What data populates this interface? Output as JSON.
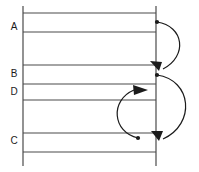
{
  "diagram": {
    "type": "interval-arc-diagram",
    "colors": {
      "background": "#ffffff",
      "line": "#4a4a4a",
      "axis": "#3a3a3a",
      "arc": "#1b1b1b",
      "label": "#1b1b1b"
    },
    "axes": {
      "left_axis": {
        "name": "left-vertical-axis",
        "x": 23,
        "y1": 6,
        "y2": 166
      },
      "right_axis": {
        "name": "right-vertical-axis",
        "x": 156,
        "y1": 6,
        "y2": 166
      }
    },
    "rows": [
      {
        "id": "row-1",
        "label": "A",
        "label_x": 14,
        "label_y": 27,
        "line_top_y": 13,
        "line_bottom_y": 32
      },
      {
        "id": "row-2",
        "label": "",
        "label_x": 14,
        "label_y": 48,
        "line_top_y": 32,
        "line_bottom_y": 65
      },
      {
        "id": "row-3",
        "label": "B",
        "label_x": 14,
        "label_y": 74,
        "line_top_y": 65,
        "line_bottom_y": 84
      },
      {
        "id": "row-4",
        "label": "D",
        "label_x": 14,
        "label_y": 92,
        "line_top_y": 84,
        "line_bottom_y": 100
      },
      {
        "id": "row-5",
        "label": "",
        "label_x": 14,
        "label_y": 116,
        "line_top_y": 100,
        "line_bottom_y": 133
      },
      {
        "id": "row-6",
        "label": "C",
        "label_x": 14,
        "label_y": 141,
        "line_top_y": 133,
        "line_bottom_y": 152
      }
    ],
    "horizontal_lines": [
      {
        "id": "hline-1",
        "y": 13,
        "x1": 23,
        "x2": 156
      },
      {
        "id": "hline-2",
        "y": 32,
        "x1": 23,
        "x2": 156
      },
      {
        "id": "hline-3",
        "y": 65,
        "x1": 23,
        "x2": 156
      },
      {
        "id": "hline-4",
        "y": 84,
        "x1": 23,
        "x2": 156
      },
      {
        "id": "hline-5",
        "y": 100,
        "x1": 23,
        "x2": 156
      },
      {
        "id": "hline-6",
        "y": 133,
        "x1": 23,
        "x2": 156
      },
      {
        "id": "hline-7",
        "y": 152,
        "x1": 23,
        "x2": 156
      }
    ],
    "arcs": [
      {
        "id": "arc-a-to-b",
        "from_label": "A",
        "to_label": "B",
        "direction": "right-outer-clockwise",
        "source_point": {
          "x": 157,
          "y": 22
        },
        "target_point": {
          "x": 161,
          "y": 70
        },
        "path": "M 157 22 C 184 26, 188 56, 163 69",
        "head_points": "163,69 152,65 158,76",
        "head_rotation": -152
      },
      {
        "id": "arc-b-to-c",
        "from_label": "B",
        "to_label": "C",
        "direction": "right-outer-clockwise",
        "source_point": {
          "x": 157,
          "y": 75
        },
        "target_point": {
          "x": 161,
          "y": 140
        },
        "path": "M 157 75 C 192 80, 196 124, 163 139",
        "head_points": "163,139 152,134 159,146",
        "head_rotation": -155
      },
      {
        "id": "arc-c-to-d",
        "from_label": "C",
        "to_label": "D",
        "direction": "left-inner-counterclockwise",
        "source_point": {
          "x": 138,
          "y": 138
        },
        "target_point": {
          "x": 147,
          "y": 90
        },
        "path": "M 138 138 C 112 132, 110 100, 134 90",
        "head_points": "147,90 133,85 133,95",
        "head_rotation": 0
      }
    ]
  }
}
